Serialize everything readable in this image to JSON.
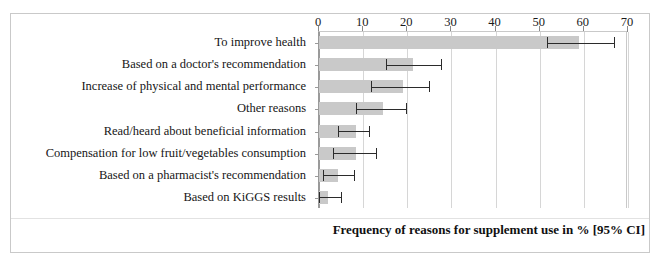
{
  "chart_data": {
    "type": "bar",
    "orientation": "horizontal",
    "title": "",
    "caption": "Frequency of reasons for supplement use in % [95% CI]",
    "xlabel": "",
    "ylabel": "",
    "xlim": [
      0,
      70
    ],
    "xticks": [
      0,
      10,
      20,
      30,
      40,
      50,
      60,
      70
    ],
    "xtick_labels": [
      "0",
      "10",
      "20",
      "30",
      "40",
      "50",
      "60",
      "70"
    ],
    "grid": "vertical",
    "legend": "none",
    "error_bars": "95% CI",
    "bar_color": "#c9c9c9",
    "error_color": "#2b2b2b",
    "categories": [
      "To improve health",
      "Based on a doctor's recommendation",
      "Increase of physical and mental performance",
      "Other reasons",
      "Read/heard about beneficial information",
      "Compensation for low fruit/vegetables consumption",
      "Based on a pharmacist's recommendation",
      "Based on KiGGS results"
    ],
    "values": [
      59.0,
      21.3,
      19.0,
      14.5,
      8.4,
      8.4,
      4.3,
      2.0
    ],
    "ci_low": [
      51.7,
      15.2,
      11.8,
      8.4,
      4.3,
      3.2,
      0.9,
      0.0
    ],
    "ci_high": [
      66.9,
      27.7,
      25.0,
      19.7,
      11.3,
      12.9,
      7.9,
      5.0
    ],
    "points": [
      {
        "label": "To improve health",
        "value": 59.0,
        "ci_low": 51.7,
        "ci_high": 66.9
      },
      {
        "label": "Based on a doctor's recommendation",
        "value": 21.3,
        "ci_low": 15.2,
        "ci_high": 27.7
      },
      {
        "label": "Increase of physical and mental performance",
        "value": 19.0,
        "ci_low": 11.8,
        "ci_high": 25.0
      },
      {
        "label": "Other reasons",
        "value": 14.5,
        "ci_low": 8.4,
        "ci_high": 19.7
      },
      {
        "label": "Read/heard about beneficial information",
        "value": 8.4,
        "ci_low": 4.3,
        "ci_high": 11.3
      },
      {
        "label": "Compensation for low fruit/vegetables consumption",
        "value": 8.4,
        "ci_low": 3.2,
        "ci_high": 12.9
      },
      {
        "label": "Based on a pharmacist's recommendation",
        "value": 4.3,
        "ci_low": 0.9,
        "ci_high": 7.9
      },
      {
        "label": "Based on KiGGS results",
        "value": 2.0,
        "ci_low": 0.0,
        "ci_high": 5.0
      }
    ]
  }
}
